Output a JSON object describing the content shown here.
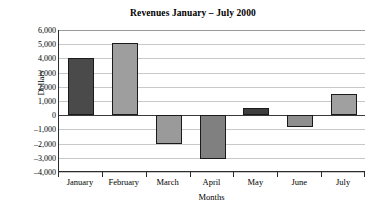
{
  "chart_data": {
    "type": "bar",
    "title": "Revenues January – July 2000",
    "xlabel": "Months",
    "ylabel": "Dollars",
    "categories": [
      "January",
      "February",
      "March",
      "April",
      "May",
      "June",
      "July"
    ],
    "values": [
      4000,
      5100,
      -2000,
      -3100,
      500,
      -800,
      1500
    ],
    "bar_colors": [
      "#4a4a4a",
      "#9e9e9e",
      "#9a9a9a",
      "#808080",
      "#3f3f3f",
      "#8f8f8f",
      "#a0a0a0"
    ],
    "bar_border_color": "#1a1a1a",
    "ylim": [
      -4000,
      6000
    ],
    "ytick_values": [
      6000,
      5000,
      4000,
      3000,
      2000,
      1000,
      0,
      -1000,
      -2000,
      -3000,
      -4000
    ],
    "ytick_labels": [
      "6,000",
      "5,000",
      "4,000",
      "3,000",
      "2,000",
      "1,000",
      "0",
      "–1,000",
      "–2,000",
      "–3,000",
      "–4,000"
    ],
    "grid": true,
    "legend": false,
    "series": [
      {
        "name": "Revenues",
        "values": [
          4000,
          5100,
          -2000,
          -3100,
          500,
          -800,
          1500
        ]
      }
    ]
  }
}
